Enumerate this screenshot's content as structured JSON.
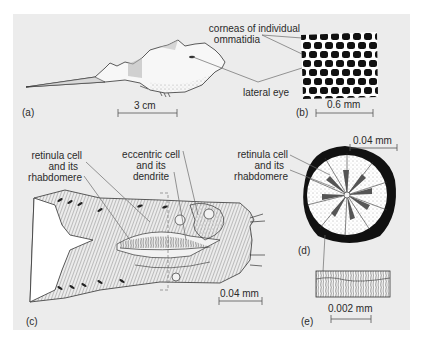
{
  "figure": {
    "panels": {
      "a": {
        "label": "(a)",
        "scale_bar": "3 cm",
        "callouts": {
          "cornea": [
            "corneas of individual",
            "ommatidia"
          ],
          "lateral_eye": "lateral eye"
        }
      },
      "b": {
        "label": "(b)",
        "scale_bar": "0.6 mm"
      },
      "c": {
        "label": "(c)",
        "scale_bar": "0.04 mm",
        "callouts": {
          "retinula": [
            "retinula cell",
            "and its",
            "rhabdomere"
          ],
          "eccentric": [
            "eccentric cell",
            "and its",
            "dendrite"
          ]
        }
      },
      "d": {
        "label": "(d)",
        "scale_bar": "0.04 mm",
        "callouts": {
          "retinula": [
            "retinula cell",
            "and its",
            "rhabdomere"
          ]
        }
      },
      "e": {
        "label": "(e)",
        "scale_bar": "0.002 mm"
      }
    },
    "colors": {
      "panel_bg": "#ececec",
      "ink": "#1a1a1a",
      "leader_line": "#6a6a6a"
    }
  }
}
